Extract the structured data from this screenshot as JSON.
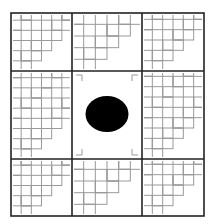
{
  "diagram": {
    "type": "tiled-grid-puzzle",
    "grid": {
      "rows": 3,
      "cols": 3
    },
    "frame": {
      "x": 11,
      "y": 13,
      "x2": 204,
      "y2": 216
    },
    "col_lines": [
      72,
      142
    ],
    "row_lines": [
      71,
      159
    ],
    "center_cell": {
      "row": 1,
      "col": 1,
      "content": "black-circle"
    },
    "circle": {
      "cx": 107,
      "cy": 114,
      "rx": 21.5,
      "ry": 18,
      "color": "#000000"
    },
    "colors": {
      "frame": "#222222",
      "tile": "#9a9a9a",
      "background": "#ffffff"
    }
  }
}
